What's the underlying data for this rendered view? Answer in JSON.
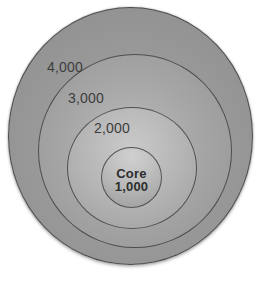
{
  "diagram": {
    "type": "concentric-circles",
    "rings": [
      {
        "id": "outer",
        "label": "4,000",
        "value": 4000
      },
      {
        "id": "middle",
        "label": "3,000",
        "value": 3000
      },
      {
        "id": "inner",
        "label": "2,000",
        "value": 2000
      },
      {
        "id": "core",
        "label": "Core",
        "value_label": "1,000",
        "value": 1000
      }
    ],
    "colors": {
      "stroke": "#3a3a3a",
      "outer_fill_dark": "#8d8d8d",
      "outer_fill_light": "#aaaaaa",
      "middle_fill_dark": "#939393",
      "middle_fill_light": "#bcbcbc",
      "inner_fill_dark": "#9d9d9d",
      "inner_fill_light": "#cacaca",
      "core_fill_dark": "#9c9c9c",
      "core_fill_light": "#d0d0d0",
      "label_text": "#3d3d3d",
      "core_text": "#2e2e2e",
      "background": "#ffffff"
    }
  }
}
